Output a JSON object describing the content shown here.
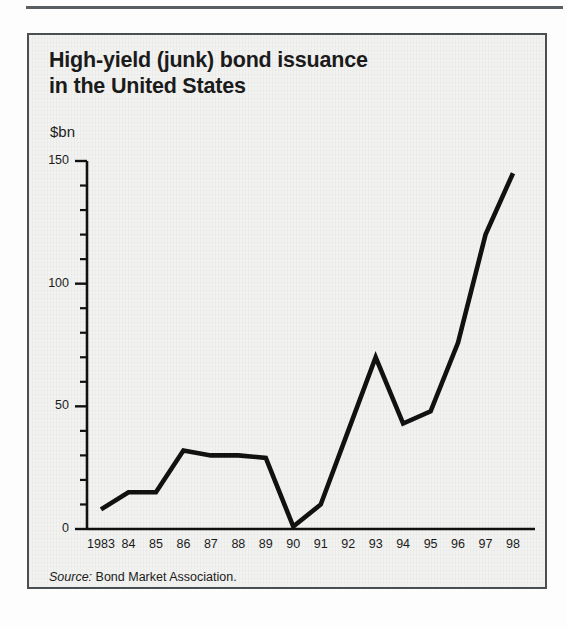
{
  "figure": {
    "title_line1": "High-yield (junk) bond issuance",
    "title_line2": "in the United States",
    "unit_label": "$bn",
    "source_label": "Source:",
    "source_text": "Bond Market Association.",
    "border_color": "#4b4f52",
    "background_color": "#f2f2f0",
    "line_color": "#111111"
  },
  "chart_data": {
    "type": "line",
    "title": "High-yield (junk) bond issuance in the United States",
    "subtitle": "",
    "xlabel": "",
    "ylabel": "$bn",
    "ylim": [
      0,
      150
    ],
    "yticks": [
      0,
      50,
      100,
      150
    ],
    "ytick_labels": [
      "0",
      "50",
      "100",
      "150"
    ],
    "y_minor_tick_step": 10,
    "grid": false,
    "legend": "none",
    "categories": [
      "1983",
      "84",
      "85",
      "86",
      "87",
      "88",
      "89",
      "90",
      "91",
      "92",
      "93",
      "94",
      "95",
      "96",
      "97",
      "98"
    ],
    "x": [
      1983,
      1984,
      1985,
      1986,
      1987,
      1988,
      1989,
      1990,
      1991,
      1992,
      1993,
      1994,
      1995,
      1996,
      1997,
      1998
    ],
    "values": [
      8,
      15,
      15,
      32,
      30,
      30,
      29,
      1,
      10,
      40,
      70,
      43,
      48,
      76,
      120,
      145
    ],
    "annotations": [],
    "source": "Bond Market Association."
  }
}
